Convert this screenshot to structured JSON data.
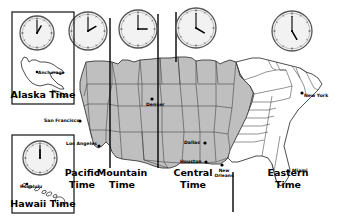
{
  "figure": {
    "kind": "us-time-zone-map",
    "background": "#ffffff",
    "land_fill": "#bfbfbf",
    "land_fill_unshaded": "#ffffff",
    "border_color": "#3a3a3a",
    "zone_line_color": "#000000",
    "clock_face": "#f2f2f2",
    "clock_rim": "#555555"
  },
  "zone_labels": [
    {
      "name": "pacific",
      "line1": "Pacific",
      "line2": "Time",
      "x": 82,
      "y": 176
    },
    {
      "name": "mountain",
      "line1": "Mountain",
      "line2": "Time",
      "x": 122,
      "y": 176
    },
    {
      "name": "central",
      "line1": "Central",
      "line2": "Time",
      "x": 193,
      "y": 176
    },
    {
      "name": "eastern",
      "line1": "Eastern",
      "line2": "Time",
      "x": 288,
      "y": 176
    }
  ],
  "insets": [
    {
      "name": "alaska",
      "caption": "Alaska Time",
      "city": "Anchorage",
      "box": {
        "x": 12,
        "y": 12,
        "w": 62,
        "h": 92
      }
    },
    {
      "name": "hawaii",
      "caption": "Hawaii Time",
      "city": "Honolulu",
      "box": {
        "x": 12,
        "y": 135,
        "w": 62,
        "h": 78
      }
    }
  ],
  "clocks": [
    {
      "name": "hawaii-clock",
      "cx": 40,
      "cy": 158,
      "r": 17,
      "hour": 12,
      "minute": 0
    },
    {
      "name": "alaska-clock",
      "cx": 37,
      "cy": 33,
      "r": 17,
      "hour": 1,
      "minute": 0
    },
    {
      "name": "pacific-clock",
      "cx": 88,
      "cy": 31,
      "r": 19,
      "hour": 2,
      "minute": 0
    },
    {
      "name": "mountain-clock",
      "cx": 138,
      "cy": 29,
      "r": 19,
      "hour": 3,
      "minute": 0
    },
    {
      "name": "central-clock",
      "cx": 196,
      "cy": 28,
      "r": 20,
      "hour": 4,
      "minute": 0
    },
    {
      "name": "eastern-clock",
      "cx": 292,
      "cy": 31,
      "r": 20,
      "hour": 5,
      "minute": 0
    }
  ],
  "cities": [
    {
      "name": "san-francisco",
      "label": "San Francisco",
      "tx": 44,
      "ty": 122,
      "dx": 80,
      "dy": 121,
      "anchor": "start"
    },
    {
      "name": "los-angeles",
      "label": "Los Angeles",
      "tx": 66,
      "ty": 145,
      "dx": 99,
      "dy": 146,
      "anchor": "start"
    },
    {
      "name": "denver",
      "label": "Denver",
      "tx": 146,
      "ty": 106,
      "dx": 152,
      "dy": 99,
      "anchor": "start"
    },
    {
      "name": "dallas",
      "label": "Dallas",
      "tx": 184,
      "ty": 144,
      "dx": 205,
      "dy": 143,
      "anchor": "start"
    },
    {
      "name": "houston",
      "label": "Houston",
      "tx": 180,
      "ty": 163,
      "dx": 206,
      "dy": 162,
      "anchor": "start"
    },
    {
      "name": "new-orleans",
      "label": "New Orleans",
      "tx": 224,
      "ty": 172,
      "dx": 222,
      "dy": 165,
      "anchor": "start"
    },
    {
      "name": "miami",
      "label": "Miami",
      "tx": 292,
      "ty": 172,
      "dx": 288,
      "dy": 171,
      "anchor": "start"
    },
    {
      "name": "new-york",
      "label": "New York",
      "tx": 304,
      "ty": 97,
      "dx": 302,
      "dy": 93,
      "anchor": "start"
    }
  ],
  "zone_lines": [
    {
      "name": "pacific-mountain-divider",
      "x": 110,
      "y1": 18,
      "y2": 168
    },
    {
      "name": "mountain-central-divider",
      "x": 158,
      "y1": 14,
      "y2": 168
    },
    {
      "name": "central-eastern-divider",
      "x": 233,
      "y1": 172,
      "y2": 212
    },
    {
      "name": "central-top-divider",
      "x": 176,
      "y1": 12,
      "y2": 62
    }
  ]
}
